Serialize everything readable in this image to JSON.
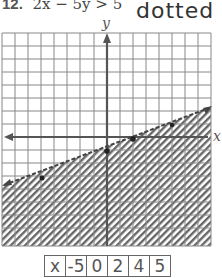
{
  "problem": {
    "number": "12.",
    "inequality": "2x − 5y > 5",
    "note": "dotted"
  },
  "graph": {
    "x_axis_label": "x",
    "y_axis_label": "y",
    "grid": {
      "columns": 16,
      "rows": 16
    },
    "boundary_line": {
      "style": "dashed",
      "equation": "y = 0.4x - 1"
    },
    "plotted_points": [
      [
        -5,
        -3
      ],
      [
        0,
        -1
      ],
      [
        2.5,
        0
      ],
      [
        5,
        1
      ]
    ],
    "shaded_region": "below line (hatched)"
  },
  "table": {
    "cells": [
      "x",
      "-5",
      "0",
      "2",
      "4",
      "5"
    ]
  }
}
